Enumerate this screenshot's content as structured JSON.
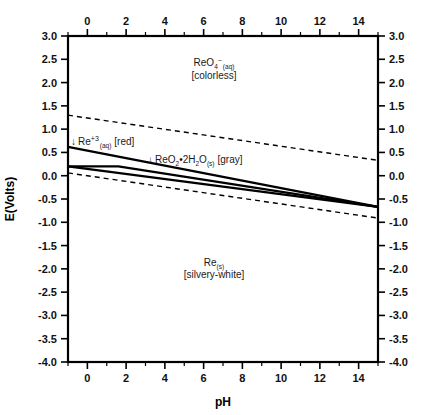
{
  "chart_data": {
    "type": "line",
    "title": "",
    "subtitle": "",
    "xlabel": "pH",
    "ylabel": "E(Volts)",
    "xlim": [
      -1,
      15
    ],
    "ylim": [
      -4.0,
      3.0
    ],
    "grid": false,
    "legend_position": "none",
    "x_ticks": [
      0,
      2,
      4,
      6,
      8,
      10,
      12,
      14
    ],
    "x_tick_labels": [
      "0",
      "2",
      "4",
      "6",
      "8",
      "10",
      "12",
      "14"
    ],
    "x_minor_step": 1,
    "y_ticks": [
      3.0,
      2.5,
      2.0,
      1.5,
      1.0,
      0.5,
      0.0,
      -0.5,
      -1.0,
      -1.5,
      -2.0,
      -2.5,
      -3.0,
      -3.5,
      -4.0
    ],
    "y_tick_labels": [
      "3.0",
      "2.5",
      "2.0",
      "1.5",
      "1.0",
      "0.5",
      "0.0",
      "-0.5",
      "-1.0",
      "-1.5",
      "-2.0",
      "-2.5",
      "-3.0",
      "-3.5",
      "-4.0"
    ],
    "axes": {
      "top_axis_ticks": true,
      "right_axis_ticks": true,
      "bottom_axis_ticks": true,
      "left_axis_ticks": true
    },
    "series": [
      {
        "name": "water-oxidation-upper-limit",
        "style": "dashed",
        "color": "#000000",
        "points": [
          [
            -1,
            1.3
          ],
          [
            15,
            0.33
          ]
        ]
      },
      {
        "name": "water-reduction-lower-limit",
        "style": "dashed",
        "color": "#000000",
        "points": [
          [
            -1,
            0.06
          ],
          [
            15,
            -0.91
          ]
        ]
      },
      {
        "name": "ReO4-/ReO2-2H2O-boundary",
        "style": "solid",
        "color": "#000000",
        "points": [
          [
            -1,
            0.62
          ],
          [
            15,
            -0.67
          ]
        ]
      },
      {
        "name": "Re+3/Re-boundary",
        "style": "solid",
        "color": "#000000",
        "points": [
          [
            -1,
            0.2
          ],
          [
            1.6,
            0.2
          ],
          [
            15,
            -0.67
          ]
        ]
      },
      {
        "name": "ReO2-2H2O/Re-boundary",
        "style": "solid",
        "color": "#000000",
        "points": [
          [
            -1,
            0.2
          ],
          [
            15,
            -0.67
          ]
        ]
      }
    ],
    "region_labels": [
      {
        "name": "ReO4-aq-region",
        "species": "ReO",
        "species_sub": "4",
        "species_sup": "−",
        "state": "(aq)",
        "descriptor": "[colorless]",
        "pH": 5.1,
        "E": 2.22
      },
      {
        "name": "Re+3-aq-region",
        "arrow": "↓",
        "species": "Re",
        "species_sup": "+3",
        "state": "(aq)",
        "descriptor": "[red]",
        "pH": -0.1,
        "E": 0.81
      },
      {
        "name": "ReO2-2H2O-s-region",
        "arrow": "↓",
        "species_parts": "ReO₂•2H₂O",
        "state": "(s)",
        "descriptor": "[gray]",
        "pH": 3.3,
        "E": 0.4
      },
      {
        "name": "Re-s-region",
        "species": "Re",
        "state": "(s)",
        "descriptor": "[silvery-white]",
        "pH": 5.1,
        "E": -2.08
      }
    ]
  },
  "labels": {
    "x_axis_title": "pH",
    "y_axis_title": "E(Volts)",
    "reo4_species": "ReO",
    "reo4_sub": "4",
    "reo4_sup": "−",
    "reo4_state": "(aq)",
    "reo4_descriptor": "[colorless]",
    "re3_arrow": "↓",
    "re3_species": "Re",
    "re3_sup": "+3",
    "re3_state": "(aq)",
    "re3_descriptor": "[red]",
    "reo2_arrow": "↓",
    "reo2_species_a": "ReO",
    "reo2_sub_a": "2",
    "reo2_dot": "•2H",
    "reo2_sub_b": "2",
    "reo2_species_b": "O",
    "reo2_state": "(s)",
    "reo2_descriptor": "[gray]",
    "re_species": "Re",
    "re_state": "(s)",
    "re_descriptor": "[silvery-white]"
  },
  "ticks": {
    "x": [
      "0",
      "2",
      "4",
      "6",
      "8",
      "10",
      "12",
      "14"
    ],
    "y": [
      "3.0",
      "2.5",
      "2.0",
      "1.5",
      "1.0",
      "0.5",
      "0.0",
      "-0.5",
      "-1.0",
      "-1.5",
      "-2.0",
      "-2.5",
      "-3.0",
      "-3.5",
      "-4.0"
    ]
  }
}
